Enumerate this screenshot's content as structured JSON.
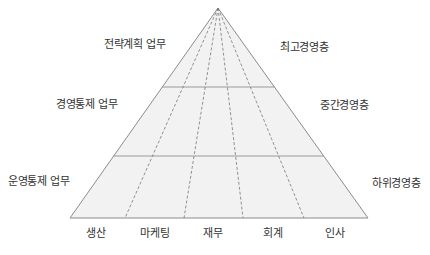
{
  "diagram": {
    "type": "pyramid",
    "left_labels": [
      "전략계획 업무",
      "경영통제 업무",
      "운영통제 업무"
    ],
    "right_labels": [
      "최고경영층",
      "중간경영층",
      "하위경영층"
    ],
    "functions": [
      "생산",
      "마케팅",
      "재무",
      "회계",
      "인사"
    ],
    "colors": {
      "fill": "#f2f2f2",
      "stroke": "#8c8c8c",
      "text": "#333333"
    }
  }
}
